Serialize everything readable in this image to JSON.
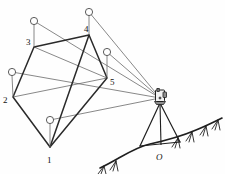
{
  "figure": {
    "colors": {
      "polygon_edge": "#2a2a2a",
      "sight_line": "#555555",
      "pole": "#6a6a6a",
      "ground": "#1f1f1f",
      "prism_fill": "#ffffff",
      "background": "#fefefe"
    }
  },
  "station": {
    "label": "O",
    "label_x": 160,
    "label_y": 158,
    "ground_x": 161,
    "ground_y": 144,
    "instrument_x": 160,
    "instrument_y": 98
  },
  "points": [
    {
      "id": "1",
      "label": "1",
      "x": 50,
      "y": 147,
      "label_x": 47,
      "label_y": 163,
      "prism_x": 50,
      "prism_y": 120,
      "prism_r": 3.6
    },
    {
      "id": "2",
      "label": "2",
      "x": 13,
      "y": 97,
      "label_x": 3,
      "label_y": 103,
      "prism_x": 12,
      "prism_y": 72,
      "prism_r": 3.6
    },
    {
      "id": "3",
      "label": "3",
      "x": 34,
      "y": 47,
      "label_x": 26,
      "label_y": 45,
      "prism_x": 34,
      "prism_y": 21,
      "prism_r": 3.6
    },
    {
      "id": "4",
      "label": "4",
      "x": 89,
      "y": 35,
      "label_x": 84,
      "label_y": 32,
      "prism_x": 89,
      "prism_y": 12,
      "prism_r": 3.6
    },
    {
      "id": "5",
      "label": "5",
      "x": 107,
      "y": 78,
      "label_x": 110,
      "label_y": 85,
      "prism_x": 107,
      "prism_y": 52,
      "prism_r": 3.6
    }
  ],
  "polygon_path": "M 50 147 L 13 97 L 34 47 L 89 35 L 107 78 Z",
  "sight_lines": [
    {
      "to": "1",
      "d": "M 160 98 L 50 120"
    },
    {
      "to": "2",
      "d": "M 160 98 L 12 72"
    },
    {
      "to": "3",
      "d": "M 160 98 L 34 21"
    },
    {
      "to": "4",
      "d": "M 160 98 L 89 12"
    },
    {
      "to": "5",
      "d": "M 160 98 L 107 52"
    }
  ],
  "extra_chords": [
    {
      "name": "chord-3-5",
      "d": "M 34 47 L 107 78"
    },
    {
      "name": "chord-2-5",
      "d": "M 13 97 L 107 78"
    },
    {
      "name": "chord-1-4",
      "d": "M 50 147 L 89 35"
    }
  ],
  "ground": {
    "path": "M 100 168 C 118 160 132 148 150 144 C 168 140 182 136 196 130 C 206 126 214 122 222 118",
    "hatch_count": 8
  },
  "tripod": {
    "legs": [
      {
        "d": "M 160 103 L 140 146"
      },
      {
        "d": "M 160 103 L 180 142"
      },
      {
        "d": "M 160 103 L 161 145"
      }
    ],
    "base_d": "M 140 146 L 180 142"
  }
}
